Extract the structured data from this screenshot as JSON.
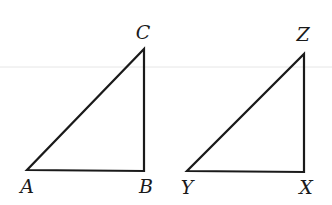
{
  "diagram": {
    "type": "geometry",
    "triangles": [
      {
        "name": "ABC",
        "vertices": [
          {
            "label": "A",
            "x": 27,
            "y": 170,
            "label_x": 27,
            "label_y": 193
          },
          {
            "label": "B",
            "x": 144,
            "y": 171,
            "label_x": 146,
            "label_y": 193
          },
          {
            "label": "C",
            "x": 144,
            "y": 49,
            "label_x": 143,
            "label_y": 39
          }
        ]
      },
      {
        "name": "YXZ",
        "vertices": [
          {
            "label": "Y",
            "x": 187,
            "y": 171,
            "label_x": 187,
            "label_y": 194
          },
          {
            "label": "X",
            "x": 304,
            "y": 172,
            "label_x": 306,
            "label_y": 194
          },
          {
            "label": "Z",
            "x": 304,
            "y": 54,
            "label_x": 303,
            "label_y": 41
          }
        ]
      }
    ],
    "colors": {
      "stroke": "#1a1a1a",
      "background": "#ffffff"
    }
  }
}
